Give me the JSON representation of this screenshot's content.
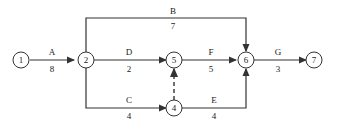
{
  "diagram": {
    "type": "activity-on-arrow network",
    "nodes": [
      {
        "id": "1",
        "label": "1"
      },
      {
        "id": "2",
        "label": "2"
      },
      {
        "id": "4",
        "label": "4"
      },
      {
        "id": "5",
        "label": "5"
      },
      {
        "id": "6",
        "label": "6"
      },
      {
        "id": "7",
        "label": "7"
      }
    ],
    "activities": [
      {
        "name": "A",
        "duration": "8",
        "from": "1",
        "to": "2"
      },
      {
        "name": "B",
        "duration": "7",
        "from": "2",
        "to": "6"
      },
      {
        "name": "D",
        "duration": "2",
        "from": "2",
        "to": "5"
      },
      {
        "name": "C",
        "duration": "4",
        "from": "2",
        "to": "4"
      },
      {
        "name": "F",
        "duration": "5",
        "from": "5",
        "to": "6"
      },
      {
        "name": "E",
        "duration": "4",
        "from": "4",
        "to": "6"
      },
      {
        "name": "G",
        "duration": "3",
        "from": "6",
        "to": "7"
      }
    ],
    "dummies": [
      {
        "from": "4",
        "to": "5",
        "style": "dashed"
      }
    ]
  }
}
